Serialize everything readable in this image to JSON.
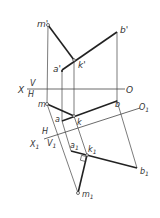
{
  "diagram": {
    "type": "orthographic projection with auxiliary plane",
    "labels": {
      "m_prime": "m'",
      "b_prime": "b'",
      "a_prime": "a'",
      "k_prime": "k'",
      "X": "X",
      "V": "V",
      "H": "H",
      "O": "O",
      "m": "m",
      "a": "a",
      "k": "k",
      "b": "b",
      "O1": "O",
      "O1_sub": "1",
      "H2": "H",
      "X1": "X",
      "X1_sub": "1",
      "V1": "V",
      "V1_sub": "1",
      "a1": "a",
      "a1_sub": "1",
      "k1": "k",
      "k1_sub": "1",
      "b1": "b",
      "b1_sub": "1",
      "m1": "m",
      "m1_sub": "1"
    },
    "colors": {
      "line": "#333333"
    }
  }
}
